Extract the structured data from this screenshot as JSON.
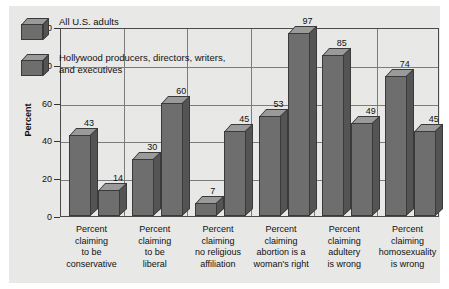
{
  "chart_data": {
    "type": "bar",
    "title": "",
    "subtitle": "",
    "xlabel": "",
    "ylabel": "Percent",
    "ylim": [
      0,
      100
    ],
    "yticks": [
      0,
      20,
      40,
      60,
      80,
      100
    ],
    "grid": true,
    "legend_position": "top-left",
    "style": "3d-grouped-bars",
    "categories": [
      "Percent\nclaiming\nto be\nconservative",
      "Percent\nclaiming\nto be\nliberal",
      "Percent\nclaiming\nno religious\naffiliation",
      "Percent\nclaiming\nabortion is a\nwoman's right",
      "Percent\nclaiming\nadultery\nis wrong",
      "Percent\nclaiming\nhomosexuality\nis wrong"
    ],
    "series": [
      {
        "name": "All U.S. adults",
        "values": [
          43,
          30,
          7,
          53,
          85,
          74
        ]
      },
      {
        "name": "Hollywood producers, directors, writers, and executives",
        "values": [
          14,
          60,
          45,
          97,
          49,
          45
        ]
      }
    ]
  },
  "legend": {
    "items": [
      {
        "label": "All U.S. adults"
      },
      {
        "label": "Hollywood producers, directors, writers, and executives"
      }
    ]
  },
  "axis": {
    "y_title": "Percent",
    "y_ticks": [
      "100",
      "80",
      "60",
      "40",
      "20",
      "0"
    ]
  },
  "colors": {
    "panel_background": "#e8e8e6",
    "page_background": "#ffffff",
    "bar_front": "#6e6e6e",
    "bar_top": "#9a9a9a",
    "bar_side": "#545454",
    "bar_outline": "#3a3a3a",
    "gridline": "#7c7c7c",
    "frame": "#4a4a4a",
    "text": "#111111"
  }
}
